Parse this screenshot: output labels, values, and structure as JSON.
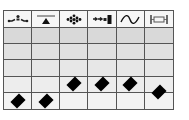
{
  "grid": {
    "columns": [
      {
        "icon": "flow-connector-icon"
      },
      {
        "icon": "triangle-on-line-icon"
      },
      {
        "icon": "dot-cluster-icon"
      },
      {
        "icon": "arrows-to-bar-icon"
      },
      {
        "icon": "sine-wave-icon"
      },
      {
        "icon": "bracketed-box-icon"
      }
    ],
    "row_count": 5,
    "row_colors": [
      "#d9d9d9",
      "#e1e1e1",
      "#e7e7e7",
      "#ededed",
      "#f3f3f3"
    ],
    "line_color": "#555555",
    "marker_color": "#000000",
    "markers": [
      {
        "column": 1,
        "row": 5,
        "position": "center"
      },
      {
        "column": 2,
        "row": 5,
        "position": "center"
      },
      {
        "column": 3,
        "row": 4,
        "position": "center"
      },
      {
        "column": 4,
        "row": 4,
        "position": "center"
      },
      {
        "column": 5,
        "row": 4,
        "position": "center"
      },
      {
        "column": 6,
        "row": 4,
        "position": "bottom-edge"
      }
    ]
  }
}
